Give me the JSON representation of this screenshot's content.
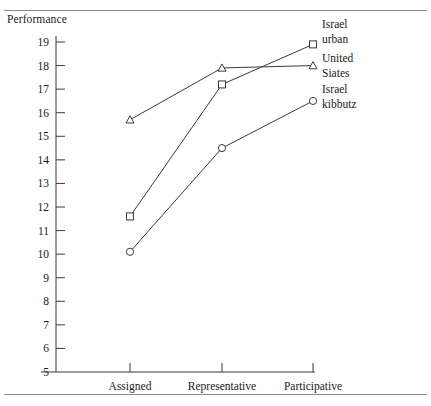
{
  "figure": {
    "ylabel": "Performance",
    "rules": {
      "top": "top-rule",
      "bottom": "bottom-rule"
    }
  },
  "chart_data": {
    "type": "line",
    "title": "",
    "xlabel": "",
    "ylabel": "Performance",
    "categories": [
      "Assigned",
      "Representative",
      "Participative"
    ],
    "yticks": [
      5,
      6,
      7,
      8,
      9,
      10,
      11,
      12,
      13,
      14,
      15,
      16,
      17,
      18,
      19
    ],
    "ylim": [
      5,
      19
    ],
    "grid": false,
    "legend_position": "right",
    "series": [
      {
        "name": "Israel urban",
        "label_line1": "Israel",
        "label_line2": "urban",
        "marker": "square",
        "values": [
          11.6,
          17.2,
          18.9
        ]
      },
      {
        "name": "United Siates",
        "label_line1": "United",
        "label_line2": "Siates",
        "marker": "triangle",
        "values": [
          15.7,
          17.9,
          18.0
        ]
      },
      {
        "name": "Israel kibbutz",
        "label_line1": "Israel",
        "label_line2": "kibbutz",
        "marker": "circle",
        "values": [
          10.1,
          14.5,
          16.5
        ]
      }
    ],
    "colors": {
      "line": "#3b3b3b",
      "marker_fill": "#ffffff",
      "text": "#1a1a1a",
      "rule": "#8a8a8a"
    }
  }
}
